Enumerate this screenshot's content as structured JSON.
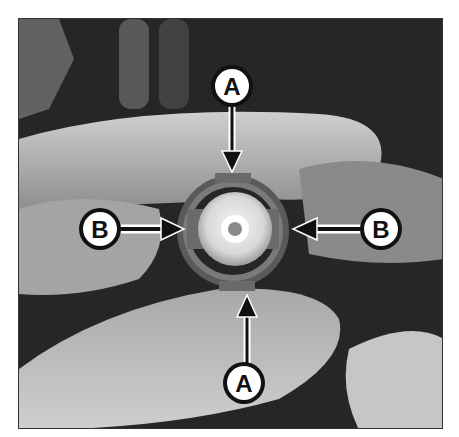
{
  "figure": {
    "callouts": [
      {
        "id": "top-a",
        "label": "A",
        "cx": 213,
        "cy": 67,
        "direction": "down"
      },
      {
        "id": "bottom-a",
        "label": "A",
        "cx": 225,
        "cy": 364,
        "direction": "up"
      },
      {
        "id": "left-b",
        "label": "B",
        "cx": 81,
        "cy": 210,
        "direction": "right"
      },
      {
        "id": "right-b",
        "label": "B",
        "cx": 362,
        "cy": 210,
        "direction": "left"
      }
    ],
    "colors": {
      "background": "#2a2a2a",
      "finger": "#bdbdbd",
      "finger_light": "#d6d6d6",
      "connector_ring": "#6a6a6a",
      "connector_core": "#e8e8e8",
      "badge_fill": "#ffffff",
      "badge_stroke": "#111111"
    }
  }
}
